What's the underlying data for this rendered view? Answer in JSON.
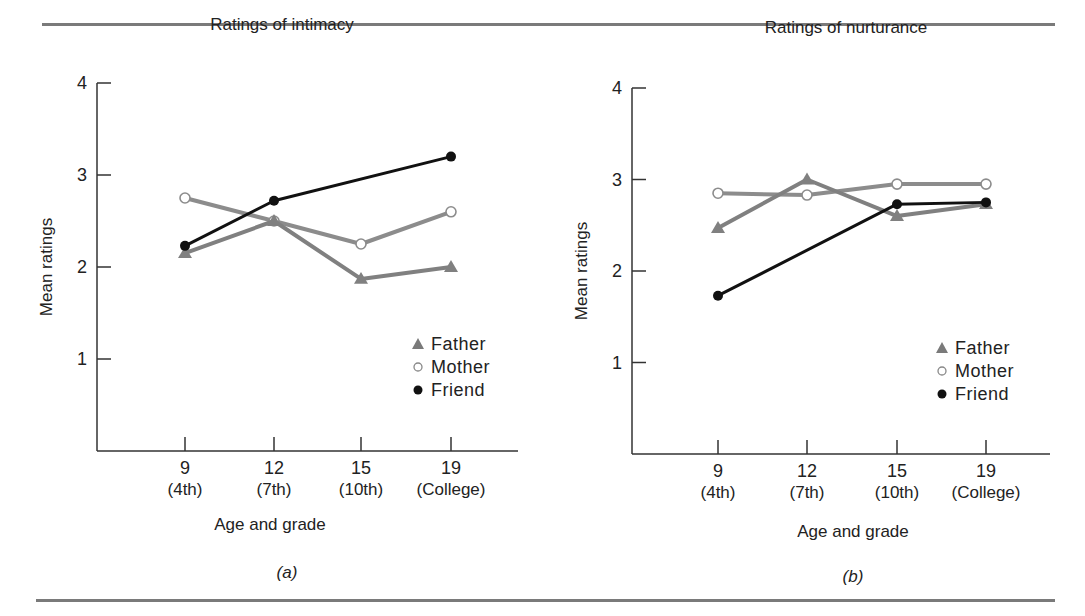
{
  "figure": {
    "rule_color": "#7a7a7a",
    "series_styles": {
      "Father": {
        "color": "#808080",
        "marker": "triangle",
        "width": 4
      },
      "Mother": {
        "color": "#8c8c8c",
        "marker": "open-circle",
        "width": 4
      },
      "Friend": {
        "color": "#111111",
        "marker": "filled-circle",
        "width": 3
      }
    }
  },
  "panels": [
    {
      "title": "Ratings of intimacy",
      "ylabel": "Mean ratings",
      "xlabel": "Age and grade",
      "panel_label": "(a)",
      "yticks": [
        "1",
        "2",
        "3",
        "4"
      ],
      "xticks": [
        {
          "age": "9",
          "grade": "(4th)"
        },
        {
          "age": "12",
          "grade": "(7th)"
        },
        {
          "age": "15",
          "grade": "(10th)"
        },
        {
          "age": "19",
          "grade": "(College)"
        }
      ],
      "legend": [
        "Father",
        "Mother",
        "Friend"
      ]
    },
    {
      "title": "Ratings of nurturance",
      "ylabel": "Mean ratings",
      "xlabel": "Age and grade",
      "panel_label": "(b)",
      "yticks": [
        "1",
        "2",
        "3",
        "4"
      ],
      "xticks": [
        {
          "age": "9",
          "grade": "(4th)"
        },
        {
          "age": "12",
          "grade": "(7th)"
        },
        {
          "age": "15",
          "grade": "(10th)"
        },
        {
          "age": "19",
          "grade": "(College)"
        }
      ],
      "legend": [
        "Father",
        "Mother",
        "Friend"
      ]
    }
  ],
  "chart_data": [
    {
      "type": "line",
      "title": "Ratings of intimacy",
      "xlabel": "Age and grade",
      "ylabel": "Mean ratings",
      "categories": [
        "9 (4th)",
        "12 (7th)",
        "15 (10th)",
        "19 (College)"
      ],
      "ylim": [
        0,
        4
      ],
      "yticks": [
        1,
        2,
        3,
        4
      ],
      "grid": false,
      "legend_position": "right-middle",
      "series": [
        {
          "name": "Father",
          "marker": "triangle",
          "values": [
            2.15,
            2.5,
            1.87,
            2.0
          ]
        },
        {
          "name": "Mother",
          "marker": "open-circle",
          "values": [
            2.75,
            2.5,
            2.25,
            2.6
          ]
        },
        {
          "name": "Friend",
          "marker": "filled-circle",
          "values": [
            2.23,
            2.72,
            null,
            3.2
          ]
        }
      ],
      "annotation": "(a)"
    },
    {
      "type": "line",
      "title": "Ratings of nurturance",
      "xlabel": "Age and grade",
      "ylabel": "Mean ratings",
      "categories": [
        "9 (4th)",
        "12 (7th)",
        "15 (10th)",
        "19 (College)"
      ],
      "ylim": [
        0,
        4
      ],
      "yticks": [
        1,
        2,
        3,
        4
      ],
      "grid": false,
      "legend_position": "right-middle",
      "series": [
        {
          "name": "Father",
          "marker": "triangle",
          "values": [
            2.47,
            3.0,
            2.6,
            2.73
          ]
        },
        {
          "name": "Mother",
          "marker": "open-circle",
          "values": [
            2.85,
            2.83,
            2.95,
            2.95
          ]
        },
        {
          "name": "Friend",
          "marker": "filled-circle",
          "values": [
            1.73,
            null,
            2.73,
            2.75
          ]
        }
      ],
      "annotation": "(b)"
    }
  ]
}
